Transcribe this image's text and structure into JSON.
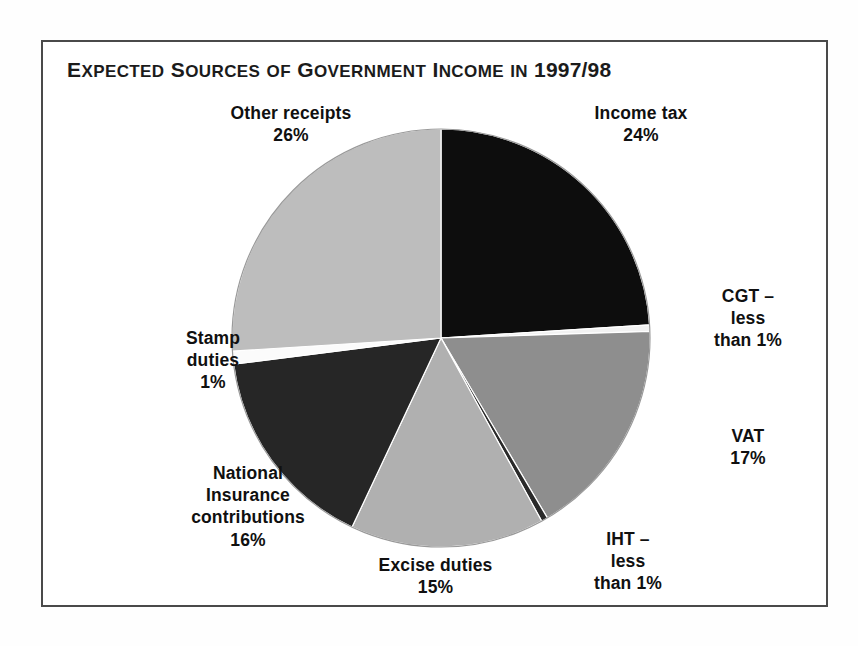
{
  "figure": {
    "title_parts": {
      "word1_first": "E",
      "word1_rest": "XPECTED",
      "word2_first": " S",
      "word2_rest": "OURCES",
      "word3_first": " ",
      "word3_rest": "OF",
      "word4_first": " G",
      "word4_rest": "OVERNMENT",
      "word5_first": " I",
      "word5_rest": "NCOME",
      "word6_first": " ",
      "word6_rest": "IN",
      "year": " 1997/98"
    },
    "title_full": "EXPECTED SOURCES OF GOVERNMENT INCOME IN 1997/98",
    "border_color": "#4a4a4a",
    "background": "#ffffff"
  },
  "chart_data": {
    "type": "pie",
    "title": "EXPECTED SOURCES OF GOVERNMENT INCOME IN 1997/98",
    "xlabel": "",
    "ylabel": "",
    "start_angle_deg": 0,
    "direction": "clockwise",
    "total_label": "100%",
    "categories": [
      "Income tax",
      "CGT",
      "VAT",
      "IHT",
      "Excise duties",
      "National Insurance contributions",
      "Stamp duties",
      "Other receipts"
    ],
    "values": [
      24,
      0.5,
      17,
      0.5,
      15,
      16,
      1,
      26
    ],
    "value_labels": [
      "24%",
      "less than 1%",
      "17%",
      "less than 1%",
      "15%",
      "16%",
      "1%",
      "26%"
    ],
    "colors": [
      "#0d0d0d",
      "#f2f2f2",
      "#8e8e8e",
      "#2a2a2a",
      "#b0b0b0",
      "#262626",
      "#fbfbfb",
      "#bdbdbd"
    ],
    "slices": [
      {
        "name": "income-tax",
        "label_lines": [
          "Income tax",
          "24%"
        ],
        "value": 24,
        "color": "#0d0d0d",
        "start_deg": 0,
        "end_deg": 86.4
      },
      {
        "name": "cgt",
        "label_lines": [
          "CGT –",
          "less",
          "than 1%"
        ],
        "value": 0.5,
        "color": "#f2f2f2",
        "start_deg": 86.4,
        "end_deg": 88.2
      },
      {
        "name": "vat",
        "label_lines": [
          "VAT",
          "17%"
        ],
        "value": 17,
        "color": "#8e8e8e",
        "start_deg": 88.2,
        "end_deg": 149.4
      },
      {
        "name": "iht",
        "label_lines": [
          "IHT –",
          "less",
          "than 1%"
        ],
        "value": 0.5,
        "color": "#2a2a2a",
        "start_deg": 149.4,
        "end_deg": 151.2
      },
      {
        "name": "excise-duties",
        "label_lines": [
          "Excise duties",
          "15%"
        ],
        "value": 15,
        "color": "#b0b0b0",
        "start_deg": 151.2,
        "end_deg": 205.2
      },
      {
        "name": "national-insurance",
        "label_lines": [
          "National",
          "Insurance",
          "contributions",
          "16%"
        ],
        "value": 16,
        "color": "#262626",
        "start_deg": 205.2,
        "end_deg": 262.8
      },
      {
        "name": "stamp-duties",
        "label_lines": [
          "Stamp",
          "duties",
          "1%"
        ],
        "value": 1,
        "color": "#fbfbfb",
        "start_deg": 262.8,
        "end_deg": 266.4
      },
      {
        "name": "other-receipts",
        "label_lines": [
          "Other receipts",
          "26%"
        ],
        "value": 26,
        "color": "#bdbdbd",
        "start_deg": 266.4,
        "end_deg": 360
      }
    ],
    "legend_position": "callout-labels",
    "grid": false,
    "geometry": {
      "center_x": 441,
      "center_y": 338,
      "radius": 209
    }
  },
  "labels": {
    "other_receipts": {
      "line1": "Other receipts",
      "line2": "26%"
    },
    "income_tax": {
      "line1": "Income tax",
      "line2": "24%"
    },
    "cgt": {
      "line1": "CGT –",
      "line2": "less",
      "line3": "than 1%"
    },
    "vat": {
      "line1": "VAT",
      "line2": "17%"
    },
    "iht": {
      "line1": "IHT –",
      "line2": "less",
      "line3": "than 1%"
    },
    "excise": {
      "line1": "Excise duties",
      "line2": "15%"
    },
    "nic": {
      "line1": "National",
      "line2": "Insurance",
      "line3": "contributions",
      "line4": "16%"
    },
    "stamp": {
      "line1": "Stamp",
      "line2": "duties",
      "line3": "1%"
    }
  }
}
